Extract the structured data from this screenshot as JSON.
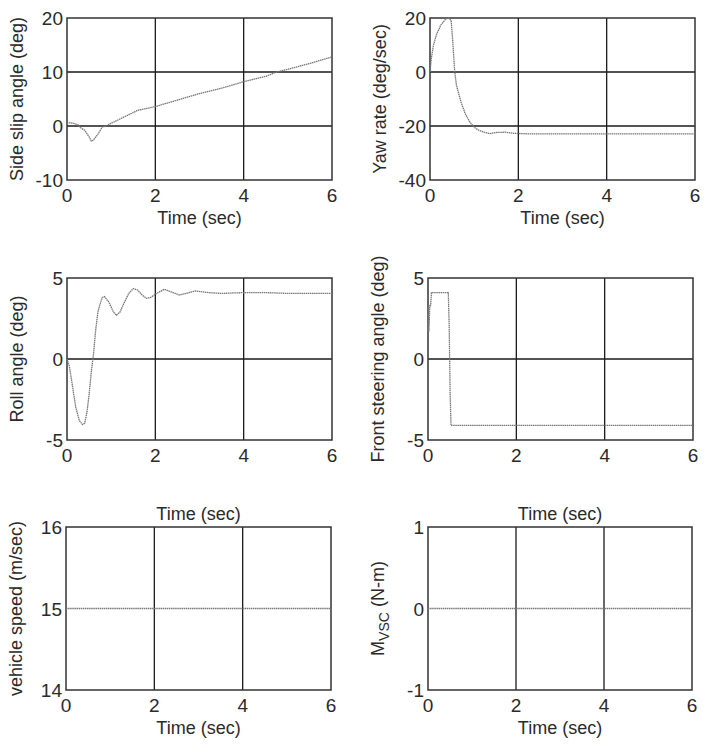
{
  "chart_data": [
    {
      "id": "side-slip",
      "type": "line",
      "title": "",
      "xlabel": "Time (sec)",
      "ylabel": "Side slip angle (deg)",
      "xlim": [
        0,
        6
      ],
      "ylim": [
        -10,
        20
      ],
      "xticks": [
        0,
        2,
        4,
        6
      ],
      "yticks": [
        -10,
        0,
        10,
        20
      ],
      "grid": true,
      "box": {
        "x": 67,
        "y": 18,
        "w": 265,
        "h": 162
      },
      "series": [
        {
          "name": "side slip angle",
          "x": [
            0,
            0.05,
            0.15,
            0.25,
            0.3,
            0.4,
            0.5,
            0.55,
            0.6,
            0.7,
            0.8,
            0.9,
            1.0,
            1.2,
            1.4,
            1.6,
            2.0,
            2.5,
            3.0,
            3.5,
            4.0,
            4.5,
            4.75,
            5.0,
            5.5,
            6.0
          ],
          "y": [
            0.5,
            0.6,
            0.5,
            0.2,
            -0.3,
            -0.8,
            -2.0,
            -2.8,
            -2.6,
            -1.5,
            -0.2,
            0.1,
            0.5,
            1.3,
            2.1,
            2.9,
            3.6,
            4.8,
            6.0,
            7.0,
            8.2,
            9.2,
            10.0,
            10.5,
            11.6,
            12.8
          ]
        }
      ]
    },
    {
      "id": "yaw-rate",
      "type": "line",
      "title": "",
      "xlabel": "Time (sec)",
      "ylabel": "Yaw rate (deg/sec)",
      "xlim": [
        0,
        6
      ],
      "ylim": [
        -40,
        20
      ],
      "xticks": [
        0,
        2,
        4,
        6
      ],
      "yticks": [
        -40,
        -20,
        0,
        20
      ],
      "grid": true,
      "box": {
        "x": 430,
        "y": 18,
        "w": 265,
        "h": 162
      },
      "series": [
        {
          "name": "yaw rate",
          "x": [
            0,
            0.03,
            0.08,
            0.15,
            0.25,
            0.35,
            0.42,
            0.48,
            0.52,
            0.56,
            0.6,
            0.7,
            0.8,
            0.9,
            1.0,
            1.1,
            1.2,
            1.35,
            1.5,
            1.7,
            1.9,
            2.2,
            3.0,
            4.0,
            5.0,
            6.0
          ],
          "y": [
            0,
            5,
            10,
            14,
            17.5,
            19.5,
            20,
            19,
            10,
            0,
            -5,
            -11,
            -15.5,
            -18.5,
            -20.5,
            -21.5,
            -22.2,
            -22.8,
            -22.4,
            -22.3,
            -22.7,
            -22.9,
            -22.9,
            -22.9,
            -22.9,
            -22.9
          ]
        }
      ]
    },
    {
      "id": "roll-angle",
      "type": "line",
      "title": "",
      "xlabel": "Time (sec)",
      "ylabel": "Roll angle (deg)",
      "xlim": [
        0,
        6
      ],
      "ylim": [
        -5,
        5
      ],
      "xticks": [
        0,
        2,
        4,
        6
      ],
      "yticks": [
        -5,
        0,
        5
      ],
      "grid": true,
      "box": {
        "x": 67,
        "y": 278,
        "w": 265,
        "h": 162
      },
      "series": [
        {
          "name": "roll angle",
          "x": [
            0,
            0.05,
            0.12,
            0.2,
            0.28,
            0.35,
            0.4,
            0.45,
            0.5,
            0.55,
            0.6,
            0.65,
            0.7,
            0.75,
            0.8,
            0.85,
            0.95,
            1.05,
            1.12,
            1.2,
            1.3,
            1.4,
            1.5,
            1.6,
            1.7,
            1.8,
            1.9,
            2.0,
            2.2,
            2.4,
            2.55,
            2.7,
            2.9,
            3.2,
            3.5,
            4.0,
            4.5,
            5.0,
            5.5,
            6.0
          ],
          "y": [
            0,
            -0.4,
            -1.6,
            -3.0,
            -3.8,
            -4.05,
            -3.95,
            -3.3,
            -2.2,
            -0.8,
            0.3,
            1.8,
            2.9,
            3.4,
            3.8,
            3.85,
            3.5,
            2.9,
            2.7,
            2.9,
            3.5,
            4.05,
            4.35,
            4.25,
            3.95,
            3.75,
            3.8,
            4.0,
            4.3,
            4.1,
            3.95,
            4.05,
            4.2,
            4.1,
            4.05,
            4.1,
            4.1,
            4.05,
            4.05,
            4.05
          ]
        }
      ]
    },
    {
      "id": "front-steering",
      "type": "line",
      "title": "",
      "xlabel": "Time (sec)",
      "ylabel": "Front steering angle (deg)",
      "xlim": [
        0,
        6
      ],
      "ylim": [
        -5,
        5
      ],
      "xticks": [
        0,
        2,
        4,
        6
      ],
      "yticks": [
        -5,
        0,
        5
      ],
      "grid": true,
      "box": {
        "x": 428,
        "y": 278,
        "w": 265,
        "h": 162
      },
      "series": [
        {
          "name": "front steering angle",
          "x": [
            0,
            0.01,
            0.02,
            0.04,
            0.06,
            0.08,
            0.46,
            0.48,
            0.5,
            0.52,
            6.0
          ],
          "y": [
            1.7,
            3.3,
            1.7,
            3.3,
            3.3,
            4.1,
            4.1,
            2.0,
            -2.0,
            -4.1,
            -4.1
          ]
        }
      ]
    },
    {
      "id": "vehicle-speed",
      "type": "line",
      "title": "Time (sec)",
      "xlabel": "Time (sec)",
      "ylabel": "vehicle speed (m/sec)",
      "xlim": [
        0,
        6
      ],
      "ylim": [
        14,
        16
      ],
      "xticks": [
        0,
        2,
        4,
        6
      ],
      "yticks": [
        14,
        15,
        16
      ],
      "grid": false,
      "vgrid_only": true,
      "box": {
        "x": 66,
        "y": 527,
        "w": 265,
        "h": 163
      },
      "series": [
        {
          "name": "vehicle speed",
          "x": [
            0,
            6
          ],
          "y": [
            15,
            15
          ]
        }
      ]
    },
    {
      "id": "m-vsc",
      "type": "line",
      "title": "Time (sec)",
      "xlabel": "Time (sec)",
      "ylabel": "M_VSC (N-m)",
      "ylabel_main": "M",
      "ylabel_sub": "VSC",
      "ylabel_rest": " (N-m)",
      "xlim": [
        0,
        6
      ],
      "ylim": [
        -1,
        1
      ],
      "xticks": [
        0,
        2,
        4,
        6
      ],
      "yticks": [
        -1,
        0,
        1
      ],
      "grid": false,
      "vgrid_only": true,
      "box": {
        "x": 428,
        "y": 527,
        "w": 264,
        "h": 163
      },
      "series": [
        {
          "name": "M_VSC",
          "x": [
            0,
            6
          ],
          "y": [
            0,
            0
          ]
        }
      ]
    }
  ]
}
